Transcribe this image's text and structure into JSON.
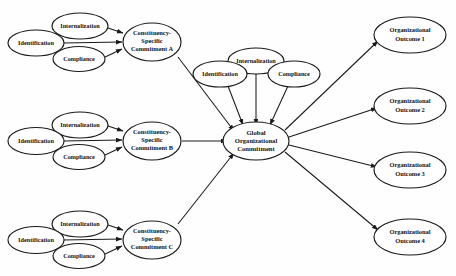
{
  "figure": {
    "type": "path-diagram",
    "background_color": "#fefefe",
    "line_color": "#1a1a1a",
    "text_color": "#121212"
  },
  "nodes": {
    "group_a": {
      "internalization": "Internalization",
      "identification": "Identification",
      "compliance": "Compliance",
      "commitment_line1": "Constituency-",
      "commitment_line2": "Specific",
      "commitment_line3": "Commitment A"
    },
    "group_b": {
      "internalization": "Internalization",
      "identification": "Identification",
      "compliance": "Compliance",
      "commitment_line1": "Constituency-",
      "commitment_line2": "Specific",
      "commitment_line3": "Commitment B"
    },
    "group_c": {
      "internalization": "Internalization",
      "identification": "Identification",
      "compliance": "Compliance",
      "commitment_line1": "Constituency-",
      "commitment_line2": "Specific",
      "commitment_line3": "Commitment C"
    },
    "group_global": {
      "internalization": "Internalization",
      "identification": "Identification",
      "compliance": "Compliance",
      "global_line1": "Global",
      "global_line2": "Organizational",
      "global_line3": "Commitment"
    },
    "outcomes": [
      {
        "line1": "Organizational",
        "line2": "Outcome 1"
      },
      {
        "line1": "Organizational",
        "line2": "Outcome 2"
      },
      {
        "line1": "Organizational",
        "line2": "Outcome 3"
      },
      {
        "line1": "Organizational",
        "line2": "Outcome 4"
      }
    ]
  }
}
